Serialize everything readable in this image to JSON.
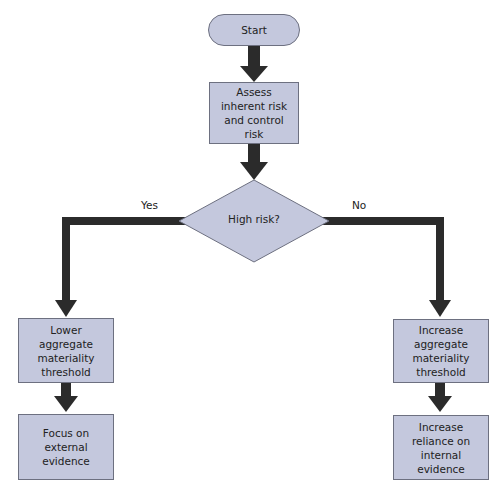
{
  "diagram": {
    "nodes": {
      "start": "Start",
      "assess": "Assess inherent risk and control risk",
      "decision": "High risk?",
      "lower_threshold": "Lower aggregate materiality threshold",
      "external_evidence": "Focus on external evidence",
      "increase_threshold": "Increase aggregate materiality threshold",
      "internal_evidence": "Increase reliance on internal evidence"
    },
    "edges": {
      "yes_label": "Yes",
      "no_label": "No"
    },
    "colors": {
      "node_fill": "#c4c8dd",
      "node_border": "#6d7080",
      "arrow": "#2b2b2b"
    }
  }
}
